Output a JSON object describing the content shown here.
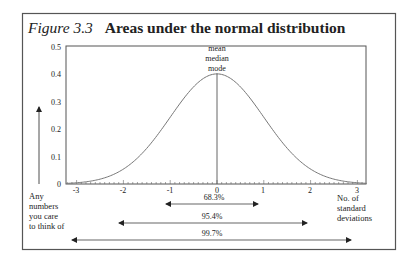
{
  "figure": {
    "label": "Figure 3.3",
    "title": "Areas under the normal distribution"
  },
  "annotations": {
    "peak": [
      "mean",
      "median",
      "mode"
    ],
    "y_note": [
      "Any",
      "numbers",
      "you care",
      "to think of"
    ],
    "x_note": [
      "No. of",
      "standard",
      "deviations"
    ]
  },
  "ranges": [
    {
      "label": "68.3%",
      "from": -1,
      "to": 1
    },
    {
      "label": "95.4%",
      "from": -2,
      "to": 2
    },
    {
      "label": "99.7%",
      "from": -3,
      "to": 3
    }
  ],
  "colors": {
    "border": "#555555",
    "curve": "#777777",
    "text": "#222222",
    "background": "#ffffff"
  },
  "chart_data": {
    "type": "line",
    "title": "Figure 3.3 Areas under the normal distribution",
    "xlabel": "No. of standard deviations",
    "ylabel": "Any numbers you care to think of",
    "x_ticks": [
      -3,
      -2,
      -1,
      0,
      1,
      2,
      3
    ],
    "x_tick_labels": [
      "-3",
      "-2",
      "-1",
      "0",
      "1",
      "2",
      "3"
    ],
    "y_ticks": [
      0,
      0.1,
      0.2,
      0.3,
      0.4,
      0.5
    ],
    "y_tick_labels": [
      "0",
      "0.1",
      "0.2",
      "0.3",
      "0.4",
      "0.5"
    ],
    "xlim": [
      -3.2,
      3.2
    ],
    "ylim": [
      0,
      0.5
    ],
    "grid": false,
    "series": [
      {
        "name": "standard normal density",
        "x": [
          -3,
          -2.5,
          -2,
          -1.5,
          -1,
          -0.5,
          0,
          0.5,
          1,
          1.5,
          2,
          2.5,
          3
        ],
        "y": [
          0.0044,
          0.0175,
          0.054,
          0.1295,
          0.242,
          0.3521,
          0.3989,
          0.3521,
          0.242,
          0.1295,
          0.054,
          0.0175,
          0.0044
        ]
      }
    ],
    "annotations": [
      {
        "text": "mean median mode",
        "x": 0,
        "y": 0.4
      },
      {
        "text": "68.3%",
        "range": [
          -1,
          1
        ]
      },
      {
        "text": "95.4%",
        "range": [
          -2,
          2
        ]
      },
      {
        "text": "99.7%",
        "range": [
          -3,
          3
        ]
      }
    ]
  }
}
